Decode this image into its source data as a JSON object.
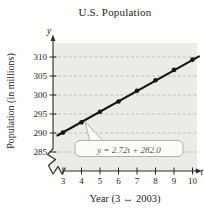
{
  "chart_data": {
    "type": "scatter",
    "title": "U.S. Population",
    "xlabel": "Year (3 ↔ 2003)",
    "ylabel": "Population (in millions)",
    "x_axis_var": "t",
    "y_axis_var": "y",
    "x": [
      3,
      4,
      5,
      6,
      7,
      8,
      9,
      10
    ],
    "values": [
      290.1,
      292.8,
      295.6,
      298.3,
      301.1,
      303.9,
      306.6,
      309.3
    ],
    "xticks": [
      "3",
      "4",
      "5",
      "6",
      "7",
      "8",
      "9",
      "10"
    ],
    "yticks": [
      "310",
      "305",
      "300",
      "295",
      "290",
      "285"
    ],
    "xlim": [
      3,
      10
    ],
    "ylim": [
      285,
      312
    ],
    "grid": true,
    "grid_style": "dashed-horizontal",
    "axis_break": true,
    "legend_position": "none",
    "trend_line": {
      "equation": "y = 2.72t + 282.0",
      "slope": 2.72,
      "intercept": 282.0
    },
    "colors": {
      "point": "#161616",
      "line": "#161616",
      "grid": "#b6b4b0",
      "plot_bg": "#edebe6",
      "axis": "#2a2a2a",
      "callout_bg": "#fdfcf9",
      "callout_border": "#a9a7a3",
      "text": "#1c1c1c"
    }
  }
}
